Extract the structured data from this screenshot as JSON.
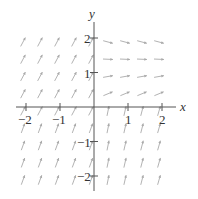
{
  "chart_data": {
    "type": "vector_field",
    "title": "",
    "xlabel": "x",
    "ylabel": "y",
    "xlim": [
      -2.3,
      2.4
    ],
    "ylim": [
      -2.4,
      2.5
    ],
    "xticks": [
      -2,
      -1,
      1,
      2
    ],
    "yticks": [
      -2,
      -1,
      1,
      2
    ],
    "xtick_labels": [
      "−2",
      "−1",
      "1",
      "2"
    ],
    "ytick_labels": [
      "−2",
      "−1",
      "1",
      "2"
    ],
    "grid": false,
    "arrow_color": "#a9a9a9",
    "axis_color": "#555555",
    "grid_spacing": 0.5
  }
}
